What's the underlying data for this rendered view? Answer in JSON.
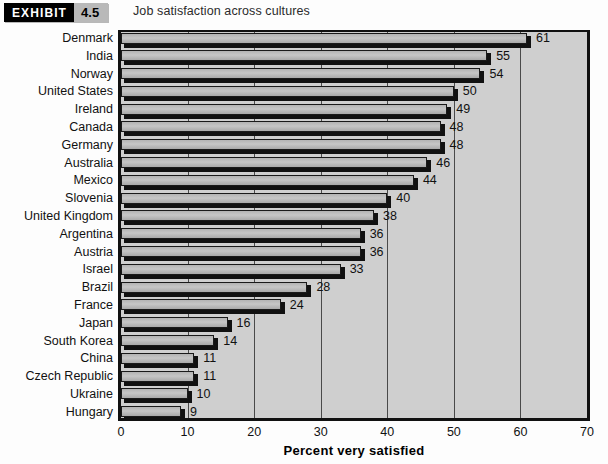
{
  "header": {
    "exhibit_word": "EXHIBIT",
    "exhibit_number": "4.5",
    "title": "Job satisfaction across cultures"
  },
  "chart_data": {
    "type": "bar",
    "orientation": "horizontal",
    "title": "Job satisfaction across cultures",
    "xlabel": "Percent very satisfied",
    "ylabel": "",
    "xlim": [
      0,
      70
    ],
    "xticks": [
      0,
      10,
      20,
      30,
      40,
      50,
      60,
      70
    ],
    "grid": true,
    "legend": null,
    "categories": [
      "Denmark",
      "India",
      "Norway",
      "United States",
      "Ireland",
      "Canada",
      "Germany",
      "Australia",
      "Mexico",
      "Slovenia",
      "United Kingdom",
      "Argentina",
      "Austria",
      "Israel",
      "Brazil",
      "France",
      "Japan",
      "South Korea",
      "China",
      "Czech Republic",
      "Ukraine",
      "Hungary"
    ],
    "values": [
      61,
      55,
      54,
      50,
      49,
      48,
      48,
      46,
      44,
      40,
      38,
      36,
      36,
      33,
      28,
      24,
      16,
      14,
      11,
      11,
      10,
      9
    ],
    "data_labels": [
      "61",
      "55",
      "54",
      "50",
      "49",
      "48",
      "48",
      "46",
      "44",
      "40",
      "38",
      "36",
      "36",
      "33",
      "28",
      "24",
      "16",
      "14",
      "11",
      "11",
      "10",
      "9"
    ]
  },
  "colors": {
    "plot_background": "#cfcfcf",
    "bar_fill": "#bdbdbd",
    "bar_outline": "#1a1a1a",
    "badge_black": "#000000",
    "badge_grey": "#b9b9b9",
    "text": "#111111"
  }
}
